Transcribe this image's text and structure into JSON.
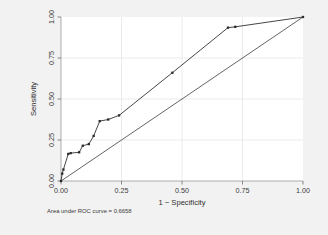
{
  "chart_data": {
    "type": "line",
    "title": "",
    "xlabel": "1 − Specificity",
    "ylabel": "Sensitivity",
    "xlim": [
      0,
      1
    ],
    "ylim": [
      0,
      1
    ],
    "grid": true,
    "legend": "none",
    "xticks": [
      "0.00",
      "0.25",
      "0.50",
      "0.75",
      "1.00"
    ],
    "xtick_values": [
      0,
      0.25,
      0.5,
      0.75,
      1
    ],
    "yticks": [
      "0.00",
      "0.25",
      "0.50",
      "0.75",
      "1.00"
    ],
    "ytick_values": [
      0,
      0.25,
      0.5,
      0.75,
      1
    ],
    "annotation": "Area under ROC curve = 0.6658",
    "auc": 0.6658,
    "series": [
      {
        "name": "ROC curve",
        "markers": true,
        "x": [
          0.0,
          0.005,
          0.01,
          0.03,
          0.04,
          0.075,
          0.09,
          0.115,
          0.135,
          0.16,
          0.195,
          0.24,
          0.46,
          0.69,
          0.72,
          1.0
        ],
        "y": [
          0.0,
          0.045,
          0.07,
          0.165,
          0.17,
          0.175,
          0.215,
          0.225,
          0.275,
          0.365,
          0.375,
          0.4,
          0.66,
          0.935,
          0.94,
          1.0
        ]
      },
      {
        "name": "Reference line",
        "markers": false,
        "x": [
          0.0,
          1.0
        ],
        "y": [
          0.0,
          1.0
        ]
      }
    ]
  },
  "figure": {
    "background_color": "#f2f2f2",
    "plot_background_color": "#ffffff",
    "line_color": "#3c3c3c"
  }
}
